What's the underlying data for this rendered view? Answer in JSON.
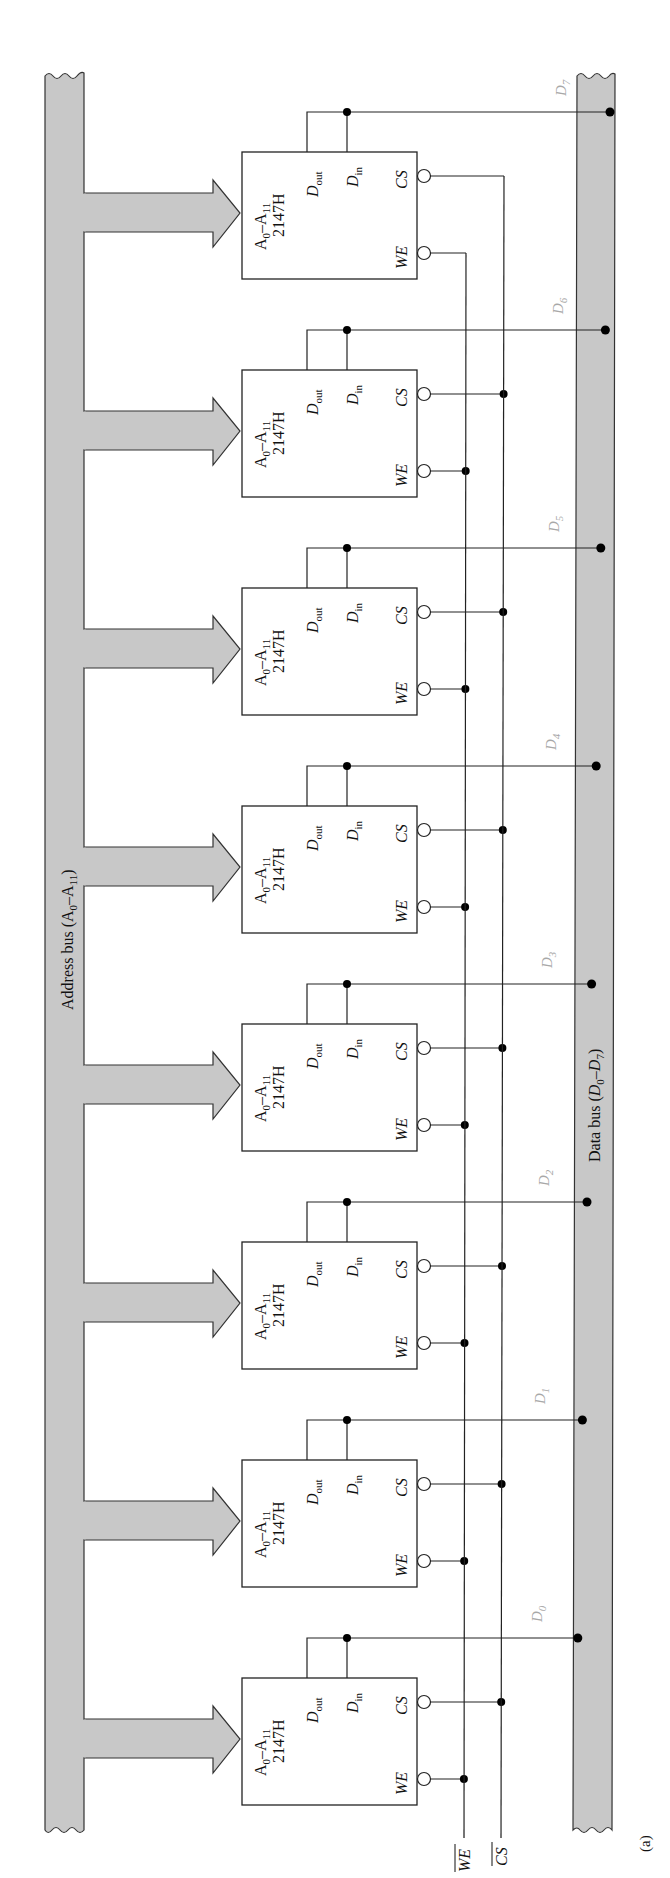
{
  "figure": {
    "label": "(a)",
    "address_bus": {
      "label": "Address bus (A",
      "label_sub1": "0",
      "label_mid": "–A",
      "label_sub2": "11",
      "label_end": ")"
    },
    "data_bus": {
      "label": "Data bus (",
      "label_d1": "D",
      "label_sub1": "0",
      "label_mid": "–",
      "label_d2": "D",
      "label_sub2": "7",
      "label_end": ")"
    },
    "control_signals": {
      "we": "WE",
      "cs": "CS"
    },
    "chip": {
      "part": "2147H",
      "addr_prefix": "A",
      "addr_sub0": "0",
      "addr_dash": "–A",
      "addr_sub11": "11",
      "dout": "D",
      "dout_sub": "out",
      "din": "D",
      "din_sub": "in",
      "cs_pin": "CS",
      "we_pin": "WE"
    },
    "chips": [
      {
        "index": 0,
        "data_line": "D",
        "data_sub": "7"
      },
      {
        "index": 1,
        "data_line": "D",
        "data_sub": "6"
      },
      {
        "index": 2,
        "data_line": "D",
        "data_sub": "5"
      },
      {
        "index": 3,
        "data_line": "D",
        "data_sub": "4"
      },
      {
        "index": 4,
        "data_line": "D",
        "data_sub": "3"
      },
      {
        "index": 5,
        "data_line": "D",
        "data_sub": "2"
      },
      {
        "index": 6,
        "data_line": "D",
        "data_sub": "1"
      },
      {
        "index": 7,
        "data_line": "D",
        "data_sub": "0"
      }
    ],
    "colors": {
      "bus_fill": "#c8c8c8",
      "data_label": "#a8a8a8",
      "line": "#222222"
    }
  }
}
